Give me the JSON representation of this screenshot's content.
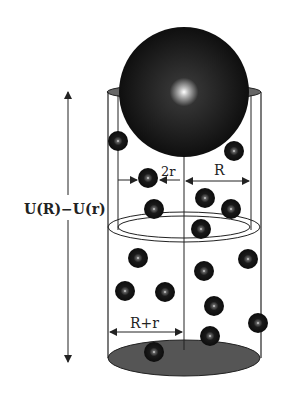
{
  "diagram": {
    "labels": {
      "potential": "U(R)−U(r)",
      "small_diameter": "2r",
      "large_radius": "R",
      "excluded_radius": "R+r"
    },
    "colors": {
      "line": "#222222",
      "sphere": "#111111",
      "bottom_fill": "#555555"
    },
    "small_spheres": [
      {
        "x": 118,
        "y": 141
      },
      {
        "x": 234,
        "y": 151
      },
      {
        "x": 148,
        "y": 178
      },
      {
        "x": 205,
        "y": 198
      },
      {
        "x": 154,
        "y": 209
      },
      {
        "x": 231,
        "y": 209
      },
      {
        "x": 201,
        "y": 229
      },
      {
        "x": 138,
        "y": 258
      },
      {
        "x": 248,
        "y": 259
      },
      {
        "x": 204,
        "y": 271
      },
      {
        "x": 125,
        "y": 291
      },
      {
        "x": 165,
        "y": 292
      },
      {
        "x": 214,
        "y": 306
      },
      {
        "x": 258,
        "y": 323
      },
      {
        "x": 210,
        "y": 336
      },
      {
        "x": 154,
        "y": 352
      }
    ]
  }
}
